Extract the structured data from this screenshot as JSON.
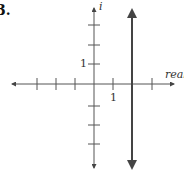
{
  "problem": {
    "number": "3."
  },
  "axes": {
    "x_label": "real",
    "y_label": "i",
    "x_unit_label": "1",
    "y_unit_label": "1",
    "origin_px": [
      94,
      84
    ],
    "unit_px": 19.5,
    "x_ticks": [
      -3,
      -2,
      -1,
      1,
      2,
      3
    ],
    "y_ticks": [
      -3,
      -2,
      -1,
      1,
      2,
      3
    ]
  },
  "graph": {
    "description": "Vertical line representing complex numbers with real part 2",
    "equation": "Re(z) = 2",
    "real_value": 2,
    "arrows_both_ends": true
  },
  "colors": {
    "axis": "#555555",
    "line": "#444444",
    "text": "#333333"
  }
}
